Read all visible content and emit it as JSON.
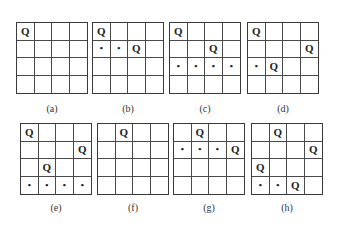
{
  "figure": {
    "boards": [
      {
        "id": "a",
        "label": "(a)",
        "cells": [
          [
            "Q",
            "",
            "",
            ""
          ],
          [
            "",
            "",
            "",
            ""
          ],
          [
            "",
            "",
            "",
            ""
          ],
          [
            "",
            "",
            "",
            ""
          ]
        ]
      },
      {
        "id": "b",
        "label": "(b)",
        "cells": [
          [
            "Q",
            "",
            "",
            ""
          ],
          [
            "•",
            "•",
            "Q",
            ""
          ],
          [
            "",
            "",
            "",
            ""
          ],
          [
            "",
            "",
            "",
            ""
          ]
        ]
      },
      {
        "id": "c",
        "label": "(c)",
        "cells": [
          [
            "Q",
            "",
            "",
            ""
          ],
          [
            "",
            "",
            "Q",
            ""
          ],
          [
            "•",
            "•",
            "•",
            "•"
          ],
          [
            "",
            "",
            "",
            ""
          ]
        ]
      },
      {
        "id": "d",
        "label": "(d)",
        "cells": [
          [
            "Q",
            "",
            "",
            ""
          ],
          [
            "",
            "",
            "",
            "Q"
          ],
          [
            "•",
            "Q",
            "",
            ""
          ],
          [
            "",
            "",
            "",
            ""
          ]
        ]
      },
      {
        "id": "e",
        "label": "(e)",
        "cells": [
          [
            "Q",
            "",
            "",
            ""
          ],
          [
            "",
            "",
            "",
            "Q"
          ],
          [
            "",
            "Q",
            "",
            ""
          ],
          [
            "•",
            "•",
            "•",
            "•"
          ]
        ]
      },
      {
        "id": "f",
        "label": "(f)",
        "cells": [
          [
            "",
            "Q",
            "",
            ""
          ],
          [
            "",
            "",
            "",
            ""
          ],
          [
            "",
            "",
            "",
            ""
          ],
          [
            "",
            "",
            "",
            ""
          ]
        ]
      },
      {
        "id": "g",
        "label": "(g)",
        "cells": [
          [
            "",
            "Q",
            "",
            ""
          ],
          [
            "•",
            "•",
            "•",
            "Q"
          ],
          [
            "",
            "",
            "",
            ""
          ],
          [
            "",
            "",
            "",
            ""
          ]
        ]
      },
      {
        "id": "h",
        "label": "(h)",
        "cells": [
          [
            "",
            "Q",
            "",
            ""
          ],
          [
            "",
            "",
            "",
            "Q"
          ],
          [
            "Q",
            "",
            "",
            ""
          ],
          [
            "•",
            "•",
            "Q",
            ""
          ]
        ]
      }
    ]
  }
}
